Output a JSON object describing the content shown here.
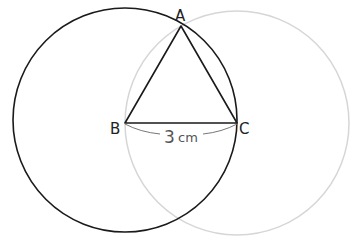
{
  "diagram": {
    "points": {
      "A": {
        "label": "A"
      },
      "B": {
        "label": "B"
      },
      "C": {
        "label": "C"
      }
    },
    "measurement": {
      "value": "3",
      "unit": "cm"
    },
    "colors": {
      "circle_b": "#1a1a1a",
      "circle_c": "#d4d4d4",
      "triangle": "#1a1a1a",
      "dimension_arc": "#777777"
    }
  }
}
